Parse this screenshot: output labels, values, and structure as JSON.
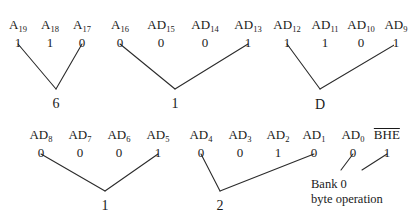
{
  "figure": {
    "line_color": "#2b2b2b",
    "text_color": "#1a1a1a",
    "background": "#ffffff"
  },
  "signals": {
    "row1": [
      {
        "name": "A",
        "sub": "19",
        "value": "1",
        "x": 18,
        "y_label": 18,
        "y_value": 36
      },
      {
        "name": "A",
        "sub": "18",
        "value": "1",
        "x": 50,
        "y_label": 18,
        "y_value": 36
      },
      {
        "name": "A",
        "sub": "17",
        "value": "0",
        "x": 82,
        "y_label": 18,
        "y_value": 36
      },
      {
        "name": "A",
        "sub": "16",
        "value": "0",
        "x": 120,
        "y_label": 18,
        "y_value": 36
      },
      {
        "name": "AD",
        "sub": "15",
        "value": "0",
        "x": 161,
        "y_label": 18,
        "y_value": 36
      },
      {
        "name": "AD",
        "sub": "14",
        "value": "0",
        "x": 205,
        "y_label": 18,
        "y_value": 36
      },
      {
        "name": "AD",
        "sub": "13",
        "value": "1",
        "x": 248,
        "y_label": 18,
        "y_value": 36
      },
      {
        "name": "AD",
        "sub": "12",
        "value": "1",
        "x": 287,
        "y_label": 18,
        "y_value": 36
      },
      {
        "name": "AD",
        "sub": "11",
        "value": "1",
        "x": 325,
        "y_label": 18,
        "y_value": 36
      },
      {
        "name": "AD",
        "sub": "10",
        "value": "0",
        "x": 361,
        "y_label": 18,
        "y_value": 36
      },
      {
        "name": "AD",
        "sub": "9",
        "value": "1",
        "x": 396,
        "y_label": 18,
        "y_value": 36
      }
    ],
    "row2": [
      {
        "name": "AD",
        "sub": "8",
        "value": "0",
        "x": 41,
        "y_label": 128,
        "y_value": 146
      },
      {
        "name": "AD",
        "sub": "7",
        "value": "0",
        "x": 80,
        "y_label": 128,
        "y_value": 146
      },
      {
        "name": "AD",
        "sub": "6",
        "value": "0",
        "x": 119,
        "y_label": 128,
        "y_value": 146
      },
      {
        "name": "AD",
        "sub": "5",
        "value": "1",
        "x": 158,
        "y_label": 128,
        "y_value": 146
      },
      {
        "name": "AD",
        "sub": "4",
        "value": "0",
        "x": 201,
        "y_label": 128,
        "y_value": 146
      },
      {
        "name": "AD",
        "sub": "3",
        "value": "0",
        "x": 240,
        "y_label": 128,
        "y_value": 146
      },
      {
        "name": "AD",
        "sub": "2",
        "value": "1",
        "x": 278,
        "y_label": 128,
        "y_value": 146
      },
      {
        "name": "AD",
        "sub": "1",
        "value": "0",
        "x": 314,
        "y_label": 128,
        "y_value": 146
      },
      {
        "name": "AD",
        "sub": "0",
        "value": "0",
        "x": 353,
        "y_label": 128,
        "y_value": 146
      },
      {
        "name": "BHE",
        "sub": "",
        "overline": true,
        "value": "1",
        "x": 387,
        "y_label": 128,
        "y_value": 146
      }
    ]
  },
  "nibbles": [
    {
      "id": "nibble-6",
      "digit": "6",
      "x": 56,
      "y": 97,
      "from_x": 18,
      "to_x": 82,
      "from_y": 44,
      "apex_y": 89
    },
    {
      "id": "nibble-1-upper",
      "digit": "1",
      "x": 175,
      "y": 97,
      "from_x": 120,
      "to_x": 248,
      "from_y": 44,
      "apex_y": 89
    },
    {
      "id": "nibble-D",
      "digit": "D",
      "x": 320,
      "y": 98,
      "from_x": 287,
      "to_x": 396,
      "from_y": 44,
      "apex_y": 89
    },
    {
      "id": "nibble-1-lower",
      "digit": "1",
      "x": 105,
      "y": 199,
      "from_x": 41,
      "to_x": 158,
      "from_y": 154,
      "apex_y": 191
    },
    {
      "id": "nibble-2",
      "digit": "2",
      "x": 220,
      "y": 199,
      "from_x": 201,
      "to_x": 314,
      "from_y": 154,
      "apex_y": 191
    }
  ],
  "bank_note": {
    "line1": "Bank 0",
    "line2": "byte operation",
    "x": 311,
    "y_line1": 177,
    "y_line2": 192,
    "pointer_left": {
      "from_x": 353,
      "from_y": 154,
      "to_x": 341,
      "to_y": 170
    },
    "pointer_right": {
      "from_x": 387,
      "from_y": 154,
      "to_x": 362,
      "to_y": 170
    }
  }
}
